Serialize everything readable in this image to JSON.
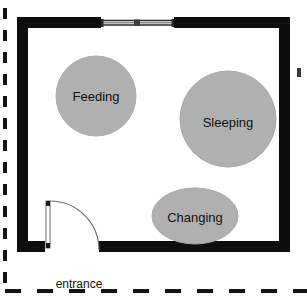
{
  "diagram": {
    "type": "architectural-floor-plan",
    "colors": {
      "wall": "#0d0d0d",
      "zone_fill": "#b0b0b0",
      "zone_stroke": "#a8a8a8",
      "background": "#ffffff",
      "boundary_dash": "#141414",
      "door_line": "#6e6e6e",
      "window_frame": "#2a2a2a",
      "label_text": "#111111"
    },
    "room": {
      "name": "nursery-room",
      "wall_thickness": 11
    },
    "zones": [
      {
        "id": "feeding",
        "label": "Feeding",
        "shape": "circle",
        "cx": 96,
        "cy": 96,
        "rx": 40,
        "ry": 40,
        "font_size": 13
      },
      {
        "id": "sleeping",
        "label": "Sleeping",
        "shape": "circle",
        "cx": 228,
        "cy": 119,
        "rx": 48,
        "ry": 48,
        "font_size": 13
      },
      {
        "id": "changing",
        "label": "Changing",
        "shape": "ellipse",
        "cx": 195,
        "cy": 216,
        "rx": 43,
        "ry": 28,
        "font_size": 13
      }
    ],
    "openings": [
      {
        "id": "window",
        "type": "window",
        "wall": "top",
        "x1": 101,
        "x2": 174,
        "y": 22
      },
      {
        "id": "entrance-door",
        "type": "door",
        "wall": "bottom",
        "label": "entrance",
        "label_x": 79,
        "label_y": 288,
        "label_font_size": 12,
        "hinge_x": 49,
        "hinge_y": 201,
        "swing_radius": 50
      }
    ],
    "boundary": {
      "id": "site-boundary",
      "style": "dashed",
      "sides": [
        "left",
        "bottom"
      ]
    },
    "marker": {
      "id": "edge-tick",
      "x": 299,
      "y": 72
    }
  }
}
